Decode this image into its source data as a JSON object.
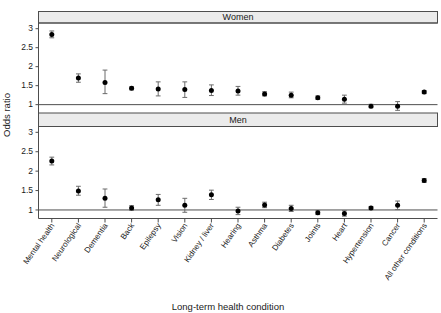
{
  "chart_data": {
    "type": "scatter",
    "title": "",
    "xlabel": "Long-term health condition",
    "ylabel": "Odds ratio",
    "categories": [
      "Mental health",
      "Neurological",
      "Dementia",
      "Back",
      "Epilepsy",
      "Vision",
      "Kidney / liver",
      "Hearing",
      "Asthma",
      "Diabetes",
      "Joints",
      "Heart",
      "Hypertension",
      "Cancer",
      "All other conditions"
    ],
    "panels": [
      {
        "label": "Women",
        "ylim": [
          0.78,
          3.15
        ],
        "yticks": [
          1,
          1.5,
          2,
          2.5,
          3
        ],
        "ytick_labels": [
          "1",
          "1.5",
          "2",
          "2.5",
          "3"
        ],
        "reference_line": 1,
        "values": [
          2.85,
          1.7,
          1.58,
          1.43,
          1.41,
          1.4,
          1.37,
          1.36,
          1.28,
          1.25,
          1.18,
          1.14,
          0.96,
          0.96,
          1.33
        ],
        "lower": [
          2.76,
          1.59,
          1.29,
          1.39,
          1.23,
          1.19,
          1.24,
          1.25,
          1.23,
          1.18,
          1.14,
          1.04,
          0.92,
          0.85,
          1.29
        ],
        "upper": [
          2.94,
          1.81,
          1.91,
          1.47,
          1.6,
          1.6,
          1.52,
          1.48,
          1.34,
          1.33,
          1.23,
          1.25,
          1.01,
          1.08,
          1.37
        ]
      },
      {
        "label": "Men",
        "ylim": [
          0.78,
          3.15
        ],
        "yticks": [
          1,
          1.5,
          2,
          2.5,
          3
        ],
        "ytick_labels": [
          "1",
          "1.5",
          "2",
          "2.5",
          "3"
        ],
        "reference_line": 1,
        "values": [
          2.26,
          1.49,
          1.3,
          1.05,
          1.26,
          1.12,
          1.39,
          0.97,
          1.13,
          1.04,
          0.93,
          0.91,
          1.05,
          1.12,
          1.76
        ],
        "lower": [
          2.16,
          1.38,
          1.07,
          0.99,
          1.12,
          0.94,
          1.27,
          0.88,
          1.06,
          0.96,
          0.88,
          0.84,
          1.01,
          1.01,
          1.71
        ],
        "upper": [
          2.36,
          1.61,
          1.54,
          1.11,
          1.4,
          1.3,
          1.51,
          1.07,
          1.2,
          1.12,
          0.98,
          0.98,
          1.09,
          1.23,
          1.81
        ]
      }
    ],
    "legend": null,
    "grid": false,
    "colors": {
      "point": "#000000",
      "whisker": "#6b6b6b",
      "strip_background": "#ebebeb",
      "axis": "#4d4d4d",
      "background": "#ffffff"
    }
  }
}
